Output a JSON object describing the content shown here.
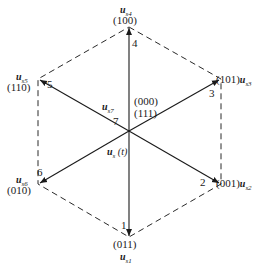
{
  "diagram": {
    "vectors": [
      {
        "id": "1",
        "name": "u",
        "sub": "s1",
        "code": "(011)"
      },
      {
        "id": "2",
        "name": "u",
        "sub": "s2",
        "code": "(001)"
      },
      {
        "id": "3",
        "name": "u",
        "sub": "s3",
        "code": "(101)"
      },
      {
        "id": "4",
        "name": "u",
        "sub": "s4",
        "code": "(100)"
      },
      {
        "id": "5",
        "name": "u",
        "sub": "s5",
        "code": "(110)"
      },
      {
        "id": "6",
        "name": "u",
        "sub": "s6",
        "code": "(010)"
      }
    ],
    "zero_vector": {
      "id": "7",
      "name": "u",
      "sub": "s7",
      "codes": [
        "(000)",
        "(111)"
      ]
    },
    "state_vector": {
      "name": "u",
      "sub": "s",
      "arg": "(t)"
    }
  }
}
